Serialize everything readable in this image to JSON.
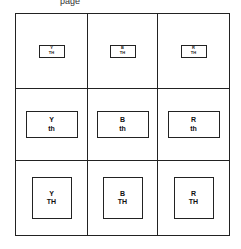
{
  "header": {
    "text": "page"
  },
  "grid": {
    "rows": [
      {
        "size": "small",
        "cells": [
          {
            "color": "Y",
            "label": "TH"
          },
          {
            "color": "B",
            "label": "TH"
          },
          {
            "color": "R",
            "label": "TH"
          }
        ]
      },
      {
        "size": "medium",
        "cells": [
          {
            "color": "Y",
            "label": "th"
          },
          {
            "color": "B",
            "label": "th"
          },
          {
            "color": "R",
            "label": "th"
          }
        ]
      },
      {
        "size": "large",
        "cells": [
          {
            "color": "Y",
            "label": "TH"
          },
          {
            "color": "B",
            "label": "TH"
          },
          {
            "color": "R",
            "label": "TH"
          }
        ]
      }
    ]
  }
}
